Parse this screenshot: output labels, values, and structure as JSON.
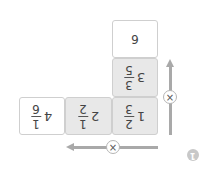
{
  "orientation": "rotated-180",
  "boxes": [
    {
      "id": "top",
      "whole": "",
      "value": "6",
      "fill": "white"
    },
    {
      "id": "column-middle",
      "whole": "3",
      "numerator": "3",
      "denominator": "5",
      "fill": "gray"
    },
    {
      "id": "corner",
      "whole": "1",
      "numerator": "2",
      "denominator": "3",
      "fill": "gray"
    },
    {
      "id": "row-middle",
      "whole": "2",
      "numerator": "1",
      "denominator": "2",
      "fill": "gray"
    },
    {
      "id": "left",
      "whole": "4",
      "numerator": "1",
      "denominator": "6",
      "fill": "white"
    }
  ],
  "operators": {
    "vertical": {
      "symbol": "×",
      "direction": "up"
    },
    "horizontal": {
      "symbol": "×",
      "direction": "left"
    }
  },
  "badge": {
    "label": "1"
  },
  "colors": {
    "gray_fill": "#e8e8e8",
    "border": "#cfcfcf",
    "arrow": "#a9a9a9",
    "badge": "#c8c8c8"
  }
}
